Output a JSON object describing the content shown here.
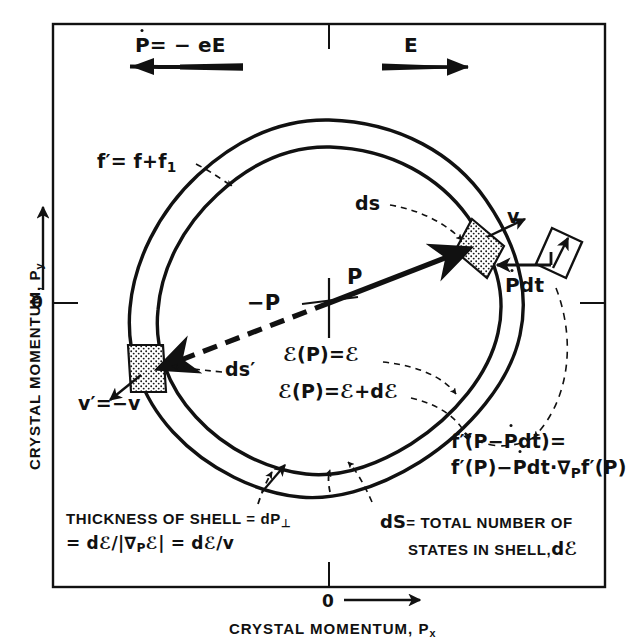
{
  "figure": {
    "type": "physics-diagram",
    "axes": {
      "y_label": "CRYSTAL MOMENTUM, P",
      "y_label_sub": "y",
      "y_origin_tick": "0",
      "x_label": "CRYSTAL MOMENTUM, P",
      "x_label_sub": "x",
      "x_origin_tick": "0"
    },
    "top_arrows": {
      "left": {
        "label_p": "P",
        "label_rest": "= − eE",
        "direction": "left",
        "meaning": "force-arrow-left"
      },
      "right": {
        "label": "E",
        "direction": "right",
        "meaning": "field-arrow-right"
      }
    },
    "annotations": {
      "outer_curve": {
        "text": "f′= f+f",
        "sub": "1"
      },
      "ds": "ds",
      "ds_prime": "ds′",
      "v_right": "v",
      "v_left_lhs": "v′",
      "v_left_rhs": "=−v",
      "momentum_p": "P",
      "momentum_minus_p": "−P",
      "energy_inner": "ℰ(P)=ℰ",
      "energy_outer": "ℰ(P)=ℰ+dℰ",
      "pdot_dt_p": "P",
      "pdot_dt_rest": "dt"
    },
    "equations": {
      "shift_line1_a": "f′(P−",
      "shift_line1_b": "P",
      "shift_line1_c": "dt)=",
      "shift_line2_a": "f′(P)−",
      "shift_line2_b": "P",
      "shift_line2_c": "dt·∇",
      "shift_line2_sub": "P",
      "shift_line2_d": "f′(P)"
    },
    "captions": {
      "left_line1": "THICKNESS OF SHELL = dP",
      "left_line1_sub": "⊥",
      "left_line2": "= dℰ/|∇",
      "left_line2_sub": "P",
      "left_line2_tail": "ℰ| = dℰ/v",
      "right_line1": "dS",
      "right_line1_rest": "= TOTAL NUMBER OF",
      "right_line2": "STATES IN SHELL,",
      "right_line2_tail": "dℰ"
    },
    "colors": {
      "ink": "#111111",
      "paper": "#ffffff",
      "stipple": "#9a9a9a"
    }
  }
}
